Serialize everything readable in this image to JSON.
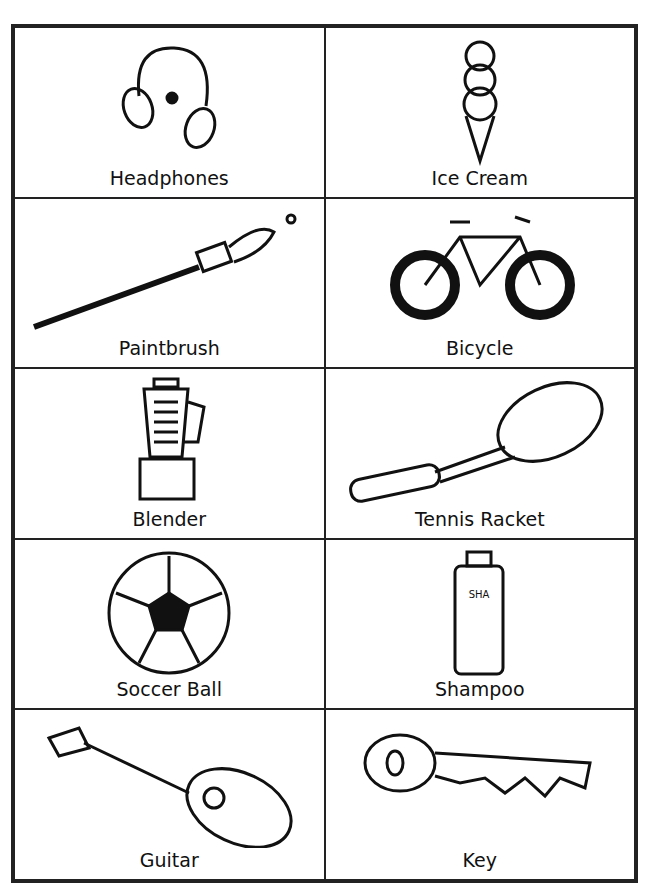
{
  "cards": [
    {
      "label": "Headphones",
      "icon": "headphones-icon"
    },
    {
      "label": "Ice Cream",
      "icon": "ice-cream-icon"
    },
    {
      "label": "Paintbrush",
      "icon": "paintbrush-icon"
    },
    {
      "label": "Bicycle",
      "icon": "bicycle-icon"
    },
    {
      "label": "Blender",
      "icon": "blender-icon"
    },
    {
      "label": "Tennis Racket",
      "icon": "tennis-racket-icon"
    },
    {
      "label": "Soccer Ball",
      "icon": "soccer-ball-icon"
    },
    {
      "label": "Shampoo",
      "icon": "shampoo-icon"
    },
    {
      "label": "Guitar",
      "icon": "guitar-icon"
    },
    {
      "label": "Key",
      "icon": "key-icon"
    }
  ]
}
